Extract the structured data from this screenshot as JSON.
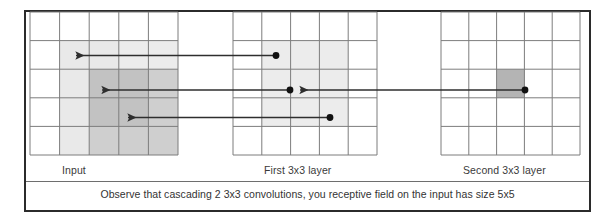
{
  "figure": {
    "title_caption": "Observe that cascading 2 3x3 convolutions, you receptive field on the input has size 5x5",
    "panels": [
      {
        "id": "input",
        "label": "Input"
      },
      {
        "id": "first-layer",
        "label": "First 3x3 layer"
      },
      {
        "id": "second-layer",
        "label": "Second 3x3 layer"
      }
    ],
    "colors": {
      "frame_border": "#2b2b2b",
      "grid_line": "#6e6e6e",
      "grid_line_light": "#9a9a9a",
      "shade_light": "#e8e8e8",
      "shade_medium": "#d8d8d8",
      "shade_dark": "#b4b4b4",
      "marker": "#111111",
      "arrow": "#333333",
      "background": "#ffffff",
      "text": "#333333"
    }
  },
  "diagram": {
    "type": "receptive-field-cascade",
    "grids": [
      {
        "name": "input",
        "rows": 5,
        "cols": 5,
        "x": 30,
        "y": 12,
        "cell_w": 29.6,
        "cell_h": 28.6,
        "shaded_regions": [
          {
            "name": "outer-receptive-field-5x5",
            "row": 1,
            "col": 1,
            "rows": 4,
            "cols": 4,
            "fill": "#ececec"
          },
          {
            "name": "inner-receptive-field-3x3",
            "row": 2,
            "col": 2,
            "rows": 3,
            "cols": 3,
            "fill": "#cfcfcf"
          }
        ]
      },
      {
        "name": "first-layer",
        "rows": 5,
        "cols": 5,
        "x": 233,
        "y": 12,
        "cell_w": 28.8,
        "cell_h": 28.6,
        "shaded_regions": [
          {
            "name": "kernel-window-3x3",
            "row": 1,
            "col": 1,
            "rows": 3,
            "cols": 3,
            "fill": "#ececec"
          }
        ]
      },
      {
        "name": "second-layer",
        "rows": 5,
        "cols": 5,
        "x": 441,
        "y": 12,
        "cell_w": 27.8,
        "cell_h": 28.6,
        "shaded_regions": [
          {
            "name": "output-unit-cell",
            "row": 2,
            "col": 2,
            "rows": 1,
            "cols": 1,
            "fill": "#b4b4b4"
          }
        ]
      }
    ],
    "markers": [
      {
        "name": "first-layer-dot-top",
        "x": 276,
        "y": 56
      },
      {
        "name": "first-layer-dot-middle",
        "x": 290,
        "y": 90
      },
      {
        "name": "first-layer-dot-bottom",
        "x": 330,
        "y": 118
      },
      {
        "name": "second-layer-dot-center",
        "x": 525,
        "y": 90
      }
    ],
    "arrows": [
      {
        "name": "arrow-first-top-to-input",
        "from_x": 274,
        "from_y": 56,
        "to_x": 78,
        "to_y": 56
      },
      {
        "name": "arrow-first-middle-to-input",
        "from_x": 288,
        "from_y": 90,
        "to_x": 104,
        "to_y": 90
      },
      {
        "name": "arrow-first-bottom-to-input",
        "from_x": 328,
        "from_y": 118,
        "to_x": 130,
        "to_y": 118
      },
      {
        "name": "arrow-second-to-first-middle",
        "from_x": 523,
        "from_y": 90,
        "to_x": 300,
        "to_y": 90
      }
    ],
    "annotation": {
      "input_receptive_field": "5x5",
      "kernel_size": "3x3",
      "num_layers": 2
    }
  }
}
